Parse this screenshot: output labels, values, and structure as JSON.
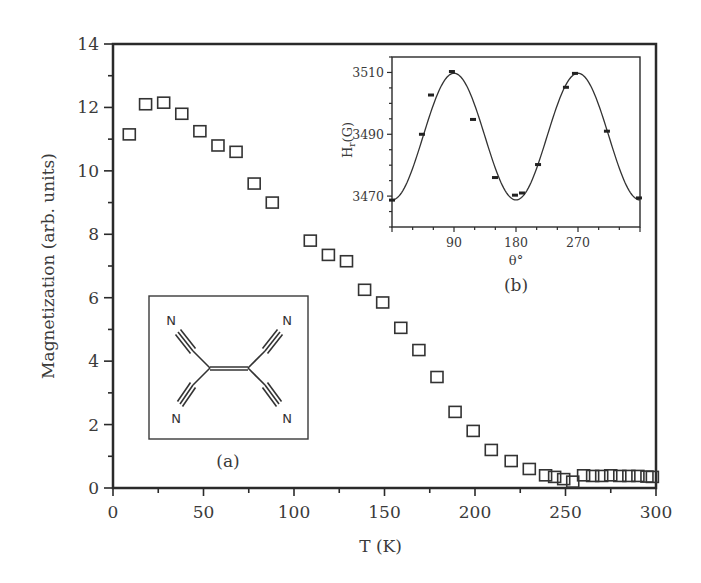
{
  "chart_data": [
    {
      "type": "scatter",
      "title": "",
      "xlabel": "T (K)",
      "ylabel": "Magnetization (arb. units)",
      "xlim": [
        0,
        300
      ],
      "ylim": [
        0,
        14
      ],
      "xticks": [
        0,
        50,
        100,
        150,
        200,
        250,
        300
      ],
      "xtick_labels": [
        "0",
        "50",
        "100",
        "150",
        "200",
        "250",
        "300"
      ],
      "yticks": [
        0,
        2,
        4,
        6,
        8,
        10,
        12,
        14
      ],
      "ytick_labels": [
        "0",
        "2",
        "4",
        "6",
        "8",
        "10",
        "12",
        "14"
      ],
      "grid": false,
      "marker": "open-square",
      "series": [
        {
          "name": "Magnetization",
          "x": [
            9,
            18,
            28,
            38,
            48,
            58,
            68,
            78,
            88,
            109,
            119,
            129,
            139,
            149,
            159,
            169,
            179,
            189,
            199,
            209,
            220,
            230,
            239,
            244,
            249,
            254,
            260,
            265,
            270,
            275,
            280,
            285,
            290,
            295,
            298
          ],
          "y": [
            11.15,
            12.1,
            12.15,
            11.8,
            11.25,
            10.8,
            10.6,
            9.6,
            9.0,
            7.8,
            7.35,
            7.15,
            6.25,
            5.85,
            5.05,
            4.35,
            3.5,
            2.4,
            1.8,
            1.2,
            0.85,
            0.6,
            0.4,
            0.35,
            0.28,
            0.2,
            0.4,
            0.38,
            0.38,
            0.4,
            0.38,
            0.38,
            0.38,
            0.36,
            0.35
          ]
        }
      ],
      "annotations": [
        {
          "text": "(a)",
          "meaning": "panel label for molecular structure inset"
        }
      ]
    },
    {
      "type": "scatter",
      "title": "",
      "panel_label": "(b)",
      "xlabel": "θ°",
      "ylabel": "H_r(G)",
      "ylabel_main": "H",
      "ylabel_sub": "r",
      "ylabel_rest": "(G)",
      "xlim": [
        0,
        360
      ],
      "ylim": [
        3460,
        3515
      ],
      "xticks": [
        90,
        180,
        270
      ],
      "xtick_labels": [
        "90",
        "180",
        "270"
      ],
      "yticks": [
        3470,
        3490,
        3510
      ],
      "ytick_labels": [
        "3470",
        "3490",
        "3510"
      ],
      "grid": false,
      "series": [
        {
          "name": "data",
          "marker": "filled-dash",
          "x": [
            0,
            43.5,
            56.6,
            87,
            117.6,
            149.5,
            178.5,
            188.7,
            212,
            252.5,
            265.6,
            312,
            358.5
          ],
          "y": [
            3468.7,
            3490,
            3502.7,
            3510.3,
            3494.8,
            3476,
            3470.3,
            3471,
            3480.2,
            3505.2,
            3509.7,
            3491,
            3469.4
          ]
        },
        {
          "name": "fit",
          "type": "line",
          "formula": "H = 3489.25 - 20.5*cos(2θ)",
          "offset": 3489.25,
          "amplitude": 20.5
        }
      ]
    }
  ],
  "molecule": {
    "panel_label": "(a)",
    "atoms": [
      "N",
      "N",
      "N",
      "N"
    ],
    "name_hint": "tetracyanoethylene structure"
  }
}
